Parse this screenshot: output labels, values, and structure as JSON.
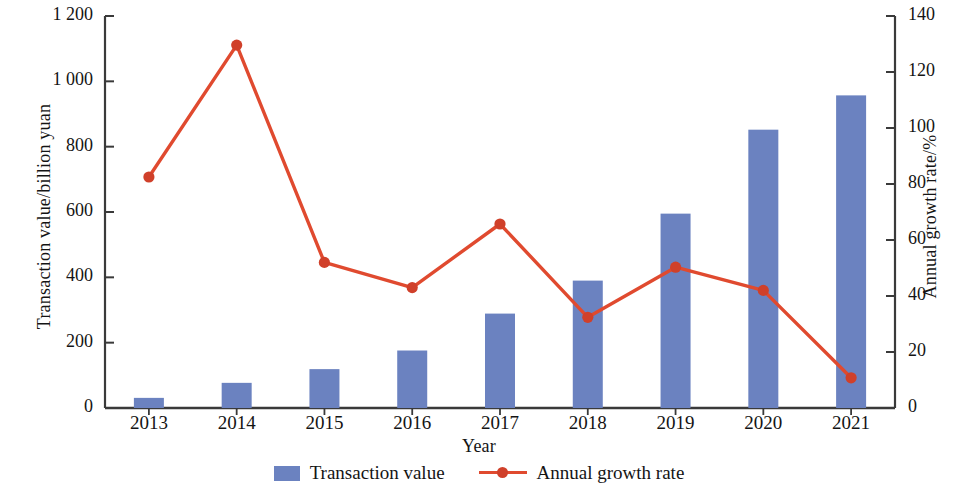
{
  "chart_data": {
    "type": "bar",
    "title": "",
    "xlabel": "Year",
    "ylabel": "Transaction value/billion yuan",
    "y2label": "Annual growth rate/%",
    "categories": [
      "2013",
      "2014",
      "2015",
      "2016",
      "2017",
      "2018",
      "2019",
      "2020",
      "2021"
    ],
    "ylim": [
      0,
      1200
    ],
    "y2lim": [
      0,
      140
    ],
    "yticks": [
      "0",
      "200",
      "400",
      "600",
      "800",
      "1 000",
      "1 200"
    ],
    "ytick_values": [
      0,
      200,
      400,
      600,
      800,
      1000,
      1200
    ],
    "y2ticks": [
      "0",
      "20",
      "40",
      "60",
      "80",
      "100",
      "120",
      "140"
    ],
    "y2tick_values": [
      0,
      20,
      40,
      60,
      80,
      100,
      120,
      140
    ],
    "grid": false,
    "legend_position": "bottom",
    "series": [
      {
        "name": "Transaction value",
        "type": "bar",
        "axis": "left",
        "color": "#6b82c0",
        "values": [
          31,
          77,
          119,
          176,
          289,
          390,
          595,
          852,
          957
        ]
      },
      {
        "name": "Annual growth rate",
        "type": "line",
        "axis": "right",
        "color": "#e04a2f",
        "marker_color": "#d0402a",
        "values": [
          82.5,
          129.6,
          52.0,
          43.0,
          65.7,
          32.4,
          50.3,
          42.0,
          10.8
        ]
      }
    ]
  },
  "legend": {
    "items": [
      {
        "label": "Transaction value",
        "marker": "bar-swatch"
      },
      {
        "label": "Annual growth rate",
        "marker": "line-marker-swatch"
      }
    ]
  }
}
